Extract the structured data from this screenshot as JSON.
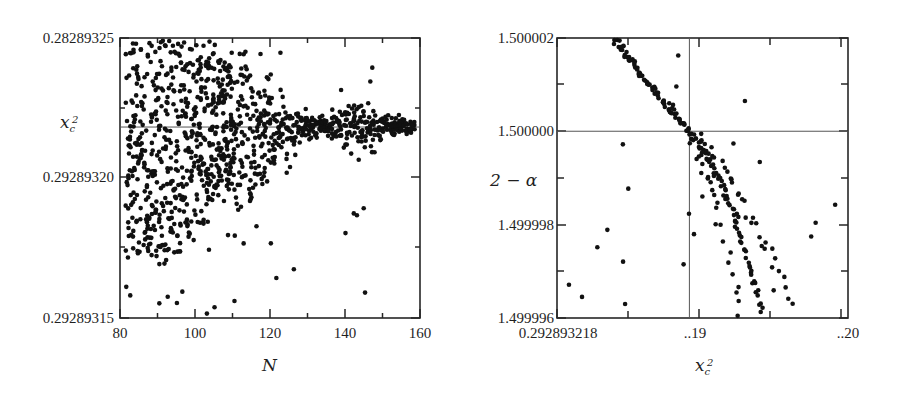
{
  "figure": {
    "background_color": "#ffffff",
    "point_color": "#111111",
    "axis_color": "#262626",
    "guide_color": "#555555",
    "panels": [
      "left",
      "right"
    ]
  },
  "chart_data": [
    {
      "type": "scatter",
      "panel": "left",
      "title": "",
      "xlabel": "N",
      "ylabel": "x_c^2",
      "ylabel_display": "x",
      "ylabel_sub": "c",
      "ylabel_sup": "2",
      "xlim": [
        80,
        160
      ],
      "ylim": [
        0.29289315,
        0.28289325
      ],
      "xticks": [
        80,
        100,
        120,
        140,
        160
      ],
      "xticklabels": [
        "80",
        "100",
        "120",
        "140",
        "160"
      ],
      "yticks": [
        0.28289325,
        0.2928932,
        0.29289315
      ],
      "yticklabels": [
        "0.28289325",
        "0.29289320",
        "0.29289315"
      ],
      "grid": false,
      "legend": "none",
      "reference_line": {
        "orientation": "horizontal",
        "value_label": "x_c^2 asymptote",
        "y_frac": 0.318
      },
      "description": "Scattered estimates of x_c^2 versus truncation order N; spread is large for N<120 and collapses onto the horizontal reference value for N>125.",
      "n_points": 980,
      "points_x": [
        82,
        83,
        84,
        85,
        86,
        87,
        88,
        89,
        90,
        91,
        92,
        93,
        94,
        95,
        96,
        97,
        98,
        99,
        100,
        101,
        102,
        103,
        104,
        105,
        106,
        107,
        108,
        109,
        110,
        111,
        112,
        113,
        114,
        115,
        116,
        117,
        118,
        119,
        120,
        121,
        122,
        123,
        124,
        125,
        126,
        127,
        128,
        129,
        130,
        131,
        132,
        133,
        134,
        135,
        136,
        137,
        138,
        139,
        140,
        141,
        142,
        143,
        144,
        145,
        146,
        147,
        148,
        149,
        150,
        151,
        152,
        153,
        154,
        155,
        156,
        157,
        158
      ],
      "spread_by_x": [
        0.95,
        0.9,
        0.88,
        0.92,
        0.85,
        0.9,
        0.95,
        0.92,
        0.97,
        1.0,
        0.98,
        0.95,
        0.93,
        0.9,
        0.92,
        0.88,
        0.85,
        0.8,
        0.78,
        0.72,
        0.7,
        0.68,
        0.62,
        0.6,
        0.55,
        0.5,
        0.48,
        0.45,
        0.42,
        0.38,
        0.35,
        0.33,
        0.3,
        0.28,
        0.25,
        0.22,
        0.2,
        0.18,
        0.16,
        0.14,
        0.12,
        0.1,
        0.09,
        0.08,
        0.07,
        0.06,
        0.05,
        0.05,
        0.04,
        0.04,
        0.035,
        0.03,
        0.03,
        0.03,
        0.03,
        0.04,
        0.05,
        0.06,
        0.06,
        0.07,
        0.08,
        0.08,
        0.09,
        0.09,
        0.08,
        0.07,
        0.06,
        0.05,
        0.05,
        0.04,
        0.04,
        0.035,
        0.03,
        0.03,
        0.03,
        0.025,
        0.02
      ]
    },
    {
      "type": "scatter",
      "panel": "right",
      "title": "",
      "xlabel": "x_c^2",
      "xlabel_display": "x",
      "xlabel_sub": "c",
      "xlabel_sup": "2",
      "ylabel": "2 - alpha",
      "ylabel_display": "2 − α",
      "xlim": [
        0.292893218,
        0.29289322
      ],
      "ylim": [
        1.499996,
        1.500002
      ],
      "xticks": [
        0.292893218,
        0.292893219,
        0.29289322
      ],
      "xticklabels": [
        "0.292893218",
        "..19",
        "..20"
      ],
      "yticks": [
        1.500002,
        1.5,
        1.499998,
        1.499996
      ],
      "yticklabels": [
        "1.500002",
        "1.500000",
        "1.499998",
        "1.499996"
      ],
      "grid": false,
      "legend": "none",
      "crosshair": {
        "horizontal_value": 1.5,
        "vertical_value_label": "x_c^2 critical",
        "x_frac": 0.455,
        "y_frac": 0.333
      },
      "description": "Scaling exponent 2 - alpha plotted against x_c^2. A dense monotonically decreasing branch crosses the 2 - alpha = 1.500000 level exactly at the critical x_c^2 marked by the vertical line, then splits into two diverging branches.",
      "n_points": 330
    }
  ],
  "labels": {
    "left": {
      "ytick_top": "0.28289325",
      "ytick_mid": "0.29289320",
      "ytick_bottom": "0.29289315",
      "ylabel": "x",
      "ylabel_sub": "c",
      "ylabel_sup": "2",
      "xtick_80": "80",
      "xtick_100": "100",
      "xtick_120": "120",
      "xtick_140": "140",
      "xtick_160": "160",
      "xlabel": "N"
    },
    "right": {
      "ytick_1": "1.500002",
      "ytick_2": "1.500000",
      "ytick_3": "1.499998",
      "ytick_4": "1.499996",
      "ylabel": "2 − α",
      "xtick_1": "0.292893218",
      "xtick_2": "..19",
      "xtick_3": "..20",
      "xlabel": "x",
      "xlabel_sub": "c",
      "xlabel_sup": "2"
    }
  }
}
